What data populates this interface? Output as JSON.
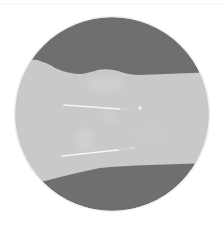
{
  "image": {
    "description": "Circular grayscale radiographic view of a limb segment with two parallel metal pins",
    "colors": {
      "background": "#ffffff",
      "rim": "#f2f2f2",
      "outer_region": "#6f6f6f",
      "tissue_band": "#c9c9c9",
      "pin": "#f6f6f6"
    },
    "circle": {
      "cx": 112,
      "cy": 114,
      "r": 97
    },
    "pins": [
      {
        "x1": 64,
        "y1": 105,
        "x2": 120,
        "y2": 109,
        "tip_x": 140,
        "tip_y": 108
      },
      {
        "x1": 62,
        "y1": 156,
        "x2": 118,
        "y2": 150,
        "tip_x": 133,
        "tip_y": 148
      }
    ]
  }
}
